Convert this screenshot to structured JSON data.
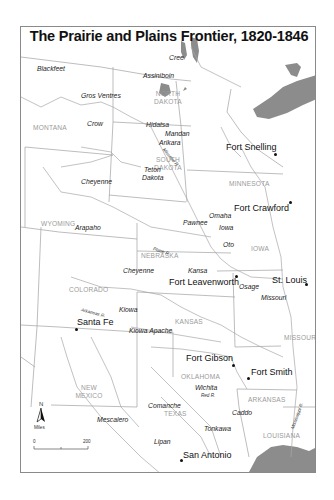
{
  "map": {
    "title": "The Prairie and Plains Frontier, 1820-1846",
    "colors": {
      "water": "#8c8c8c",
      "border": "#9a9a9a",
      "state_label": "#9a9a9a",
      "text": "#111111"
    },
    "states": {
      "montana": "MONTANA",
      "north_dakota_1": "NORTH",
      "north_dakota_2": "DAKOTA",
      "south_dakota_1": "SOUTH",
      "south_dakota_2": "DAKOTA",
      "minnesota": "MINNESOTA",
      "wyoming": "WYOMING",
      "nebraska": "NEBRASKA",
      "iowa": "IOWA",
      "colorado": "COLORADO",
      "kansas": "KANSAS",
      "missouri": "MISSOURI",
      "new_mexico_1": "NEW",
      "new_mexico_2": "MEXICO",
      "oklahoma": "OKLAHOMA",
      "arkansas": "ARKANSAS",
      "texas": "TEXAS",
      "louisiana": "LOUISIANA"
    },
    "tribes": {
      "cree": "Cree",
      "blackfeet": "Blackfeet",
      "assiniboin": "Assiniboin",
      "gros_ventres": "Gros Ventres",
      "crow": "Crow",
      "hidatsa": "Hidatsa",
      "mandan": "Mandan",
      "arikara": "Arikara",
      "cheyenne_north": "Cheyenne",
      "teton_1": "Teton",
      "teton_2": "Dakota",
      "arapaho": "Arapaho",
      "pawnee": "Pawnee",
      "omaha": "Omaha",
      "iowa": "Iowa",
      "oto": "Oto",
      "cheyenne_south": "Cheyenne",
      "kansa": "Kansa",
      "osage": "Osage",
      "missouri": "Missouri",
      "kiowa": "Kiowa",
      "kiowa_apache": "Kiowa Apache",
      "wichita": "Wichita",
      "comanche": "Comanche",
      "caddo": "Caddo",
      "mescalero": "Mescalero",
      "tonkawa": "Tonkawa",
      "lipan": "Lipan"
    },
    "cities": {
      "fort_snelling": "Fort Snelling",
      "fort_crawford": "Fort Crawford",
      "fort_leavenworth": "Fort Leavenworth",
      "st_louis": "St. Louis",
      "santa_fe": "Santa Fe",
      "fort_gibson": "Fort Gibson",
      "fort_smith": "Fort Smith",
      "san_antonio": "San Antonio"
    },
    "rivers": {
      "missouri": "Missouri R.",
      "platte": "Platte R.",
      "arkansas": "Arkansas R.",
      "red": "Red R.",
      "mississippi": "Mississippi R."
    },
    "legend": {
      "north": "N",
      "units": "Miles",
      "scale_start": "0",
      "scale_end": "200"
    }
  }
}
